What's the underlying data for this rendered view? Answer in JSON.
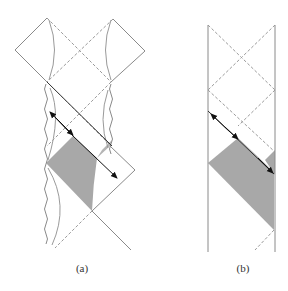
{
  "figure": {
    "panels": [
      {
        "id": "a",
        "label": "(a)",
        "description": "Penrose diagram with wavy singularities, two diamonds, shaded region and null ray with arrows"
      },
      {
        "id": "b",
        "label": "(b)",
        "description": "Strip Penrose diagram with vertical boundaries, shaded region and null ray with arrows"
      }
    ],
    "colors": {
      "line": "#8a8a8a",
      "dashed": "#9a9a9a",
      "shade": "#a8a8a8",
      "arrow": "#111111"
    }
  }
}
